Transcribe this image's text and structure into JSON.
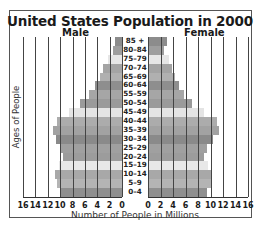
{
  "chart_data": {
    "type": "bar",
    "subtype": "population-pyramid",
    "title": "United States Population in 2000",
    "xlabel": "Number of People in Millions",
    "ylabel": "Ages of People",
    "xlim": [
      0,
      16
    ],
    "x_ticks": [
      0,
      2,
      4,
      6,
      8,
      10,
      12,
      14,
      16
    ],
    "grid": true,
    "categories": [
      "85 +",
      "80–84",
      "75–79",
      "70–74",
      "65–69",
      "60–64",
      "55–59",
      "50–54",
      "45–49",
      "40–44",
      "35–39",
      "30–34",
      "25–29",
      "20–24",
      "15–19",
      "10–14",
      "5–9",
      "0–4"
    ],
    "series": [
      {
        "name": "Male",
        "side": "left",
        "values": [
          1.2,
          1.5,
          2.3,
          3.0,
          3.6,
          4.4,
          5.4,
          6.8,
          8.6,
          10.5,
          11.2,
          10.7,
          10.1,
          9.6,
          10.2,
          10.9,
          10.5,
          9.9
        ]
      },
      {
        "name": "Female",
        "side": "right",
        "values": [
          3.0,
          2.5,
          3.4,
          3.9,
          4.3,
          4.9,
          5.8,
          7.1,
          8.9,
          11.0,
          11.4,
          10.4,
          9.4,
          9.0,
          9.6,
          10.2,
          10.0,
          9.4
        ]
      }
    ],
    "row_colors": [
      "#8c8c8c",
      "#9e9e9e",
      "#e6e6e6",
      "#a4a4a4",
      "#b0b0b0",
      "#8e8e8e",
      "#a6a6a6",
      "#9a9a9a",
      "#e4e4e4",
      "#acacac",
      "#a2a2a2",
      "#8a8a8a",
      "#a0a0a0",
      "#9c9c9c",
      "#e8e8e8",
      "#a8a8a8",
      "#b4b4b4",
      "#8f8f8f"
    ]
  },
  "labels": {
    "title": "United States Population in 2000",
    "male": "Male",
    "female": "Female",
    "xlabel": "Number of People in Millions",
    "ylabel": "Ages of People"
  },
  "male_ticks": [
    "16",
    "14",
    "12",
    "10",
    "8",
    "6",
    "4",
    "2",
    "0"
  ],
  "female_ticks": [
    "0",
    "2",
    "4",
    "6",
    "8",
    "10",
    "12",
    "14",
    "16"
  ]
}
